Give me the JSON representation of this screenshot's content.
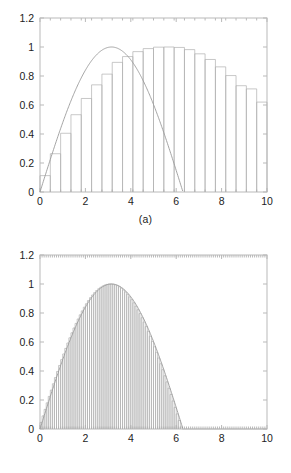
{
  "figure": {
    "background_color": "#ffffff",
    "axis_color": "#b9b9b9",
    "curve_color": "#9a9a9a",
    "bar_color": "#b0b0b0",
    "text_color": "#1c1c1c"
  },
  "panels": [
    {
      "id": "a",
      "caption": "(a)",
      "chart_data": {
        "type": "bar",
        "title": "",
        "subtitle": "",
        "xlabel": "",
        "ylabel": "",
        "xlim": [
          0,
          10
        ],
        "ylim": [
          0,
          1.2
        ],
        "grid": false,
        "legend": null,
        "legend_position": "none",
        "xticks": [
          0,
          2,
          4,
          6,
          8,
          10
        ],
        "xticklabels": [
          "0",
          "2",
          "4",
          "6",
          "8",
          "10"
        ],
        "yticks": [
          0,
          0.2,
          0.4,
          0.6,
          0.8,
          1,
          1.2
        ],
        "yticklabels": [
          "0",
          "0.2",
          "0.4",
          "0.6",
          "0.8",
          "1",
          "1.2"
        ],
        "minor_xtick_interval": 0.454545,
        "description": "Coarse Riemann (left-endpoint style) rectangles under a smooth sine-like arc",
        "bar_count": 22,
        "bar_width": 0.4545,
        "series": [
          {
            "name": "rectangles",
            "type": "bar",
            "x_left": [
              0.0,
              0.4545,
              0.9091,
              1.3636,
              1.8182,
              2.2727,
              2.7273,
              3.1818,
              3.6364,
              4.0909,
              4.5455,
              5.0,
              5.4545,
              5.9091,
              6.3636,
              6.8182,
              7.2727,
              7.7273,
              8.1818,
              8.6364,
              9.0909,
              9.5455
            ],
            "values": [
              0.113,
              0.264,
              0.405,
              0.533,
              0.645,
              0.739,
              0.813,
              0.894,
              0.934,
              0.968,
              0.989,
              0.999,
              1.0,
              0.997,
              0.982,
              0.953,
              0.914,
              0.863,
              0.803,
              0.733,
              0.711,
              0.62
            ]
          },
          {
            "name": "curve",
            "type": "line",
            "expression": "sin(x*0.4987)",
            "x": [
              0,
              0.5,
              1,
              1.5,
              2,
              2.5,
              3,
              3.5,
              4,
              4.5,
              5,
              5.5,
              6,
              6.3,
              6.5,
              7,
              7.5,
              8,
              8.5,
              9,
              9.5,
              10
            ],
            "values": [
              0.0,
              0.247,
              0.478,
              0.681,
              0.841,
              0.949,
              0.997,
              0.984,
              0.909,
              0.778,
              0.6,
              0.389,
              0.158,
              0.014,
              -0.08,
              -0.31,
              -0.52,
              -0.7,
              -0.84,
              -0.94,
              -0.99,
              -1.0
            ]
          }
        ]
      }
    },
    {
      "id": "b",
      "caption": "(b)",
      "chart_data": {
        "type": "bar",
        "title": "",
        "subtitle": "",
        "xlabel": "",
        "ylabel": "",
        "xlim": [
          0,
          10
        ],
        "ylim": [
          0,
          1.2
        ],
        "grid": false,
        "legend": null,
        "legend_position": "none",
        "xticks": [
          0,
          2,
          4,
          6,
          8,
          10
        ],
        "xticklabels": [
          "0",
          "2",
          "4",
          "6",
          "8",
          "10"
        ],
        "yticks": [
          0,
          0.2,
          0.4,
          0.6,
          0.8,
          1,
          1.2
        ],
        "yticklabels": [
          "0",
          "0.2",
          "0.4",
          "0.6",
          "0.8",
          "1",
          "1.2"
        ],
        "minor_xtick_interval": 0.0909,
        "description": "Fine Riemann rectangles (dense vertical lines) under the same smooth sine-like arc",
        "bar_count": 110,
        "bar_width": 0.0909,
        "series": [
          {
            "name": "rectangles",
            "type": "bar",
            "expression": "sin(x*0.4987)",
            "x_start": 0,
            "x_step": 0.0909,
            "peak_value": 1.0,
            "peak_x": 6.3,
            "end_value": 0.62
          },
          {
            "name": "curve",
            "type": "line",
            "expression": "sin(x*0.4987)",
            "x": [
              0,
              0.5,
              1,
              1.5,
              2,
              2.5,
              3,
              3.5,
              4,
              4.5,
              5,
              5.5,
              6,
              6.3,
              6.5,
              7,
              7.5,
              8,
              8.5,
              9,
              9.5,
              10
            ],
            "values": [
              0.0,
              0.247,
              0.478,
              0.681,
              0.841,
              0.949,
              0.997,
              0.984,
              0.909,
              0.778,
              0.6,
              0.389,
              0.158,
              0.014,
              -0.08,
              -0.31,
              -0.52,
              -0.7,
              -0.84,
              -0.94,
              -0.99,
              -1.0
            ]
          }
        ]
      }
    }
  ]
}
